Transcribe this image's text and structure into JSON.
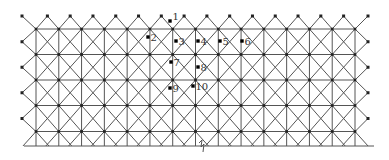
{
  "diagram": {
    "type": "space-grid-truss-plan",
    "colors": {
      "line": "#555555",
      "node": "#222222",
      "background": "#ffffff"
    },
    "grid": {
      "columns": 15,
      "rows": 5,
      "x_start": 36,
      "x_end": 355,
      "y_rows": [
        29,
        54.5,
        80,
        105.5,
        131.5
      ],
      "bottom_edge_y": 146,
      "top_support_y": 16,
      "left_support_x": 22,
      "right_support_x": 368
    },
    "break_mark": {
      "x": 202,
      "y": 146
    },
    "labeled_points": [
      {
        "id": "1",
        "label": "1",
        "x": 170,
        "y": 21
      },
      {
        "id": "2",
        "label": "2",
        "x": 148,
        "y": 37
      },
      {
        "id": "3",
        "label": "3",
        "x": 176,
        "y": 41
      },
      {
        "id": "4",
        "label": "4",
        "x": 198,
        "y": 41
      },
      {
        "id": "5",
        "label": "5",
        "x": 220,
        "y": 41
      },
      {
        "id": "6",
        "label": "6",
        "x": 242,
        "y": 41
      },
      {
        "id": "7",
        "label": "7",
        "x": 171,
        "y": 62
      },
      {
        "id": "8",
        "label": "8",
        "x": 198,
        "y": 67
      },
      {
        "id": "9",
        "label": "9",
        "x": 170,
        "y": 88
      },
      {
        "id": "10",
        "label": "10",
        "x": 193,
        "y": 86
      }
    ]
  }
}
